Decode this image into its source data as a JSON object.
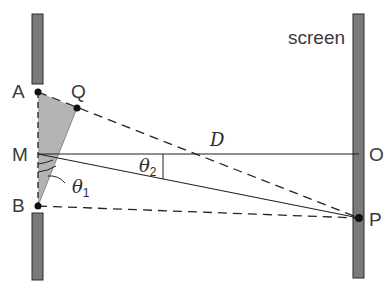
{
  "diagram": {
    "labels": {
      "screen": "screen",
      "A": "A",
      "Q": "Q",
      "M": "M",
      "B": "B",
      "O": "O",
      "P": "P",
      "D": "D",
      "theta1_symbol": "θ",
      "theta1_sub": "1",
      "theta2_symbol": "θ",
      "theta2_sub": "2"
    },
    "colors": {
      "barrier_fill": "#7a7a7a",
      "barrier_stroke": "#2a2a2a",
      "shaded_triangle": "#b3b3b3",
      "line": "#222222",
      "background": "#ffffff"
    },
    "points": {
      "A": [
        38,
        92
      ],
      "Q": [
        77,
        108
      ],
      "M": [
        38,
        154
      ],
      "B": [
        38,
        206
      ],
      "O": [
        359,
        154
      ],
      "P": [
        359,
        218
      ]
    }
  }
}
